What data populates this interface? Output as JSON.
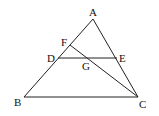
{
  "figure": {
    "points": {
      "A": {
        "label": "A",
        "x": 93,
        "y": 19,
        "lx": 89,
        "ly": 16
      },
      "B": {
        "label": "B",
        "x": 24,
        "y": 97,
        "lx": 14,
        "ly": 106
      },
      "C": {
        "label": "C",
        "x": 138,
        "y": 97,
        "lx": 139,
        "ly": 108
      },
      "D": {
        "label": "D",
        "x": 58,
        "y": 58,
        "lx": 47,
        "ly": 62
      },
      "E": {
        "label": "E",
        "x": 117,
        "y": 58,
        "lx": 119,
        "ly": 62
      },
      "F": {
        "label": "F",
        "x": 70,
        "y": 45,
        "lx": 61,
        "ly": 46
      },
      "G": {
        "label": "G",
        "x": 86,
        "y": 58,
        "lx": 82,
        "ly": 70
      }
    },
    "segments": [
      [
        "A",
        "B"
      ],
      [
        "A",
        "C"
      ],
      [
        "B",
        "C"
      ],
      [
        "D",
        "E"
      ],
      [
        "F",
        "C"
      ]
    ]
  }
}
